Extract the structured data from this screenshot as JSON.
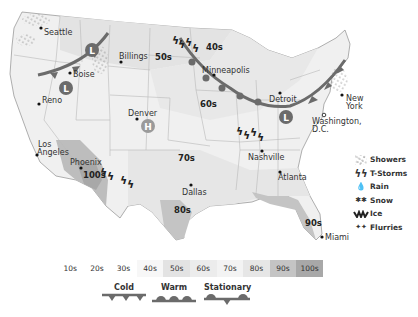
{
  "map": {
    "cities": [
      {
        "name": "Seattle"
      },
      {
        "name": "Boise"
      },
      {
        "name": "Billings"
      },
      {
        "name": "Reno"
      },
      {
        "name": "Denver"
      },
      {
        "name": "Minneapolis"
      },
      {
        "name": "Detroit"
      },
      {
        "name": "New York",
        "line1": "New",
        "line2": "York"
      },
      {
        "name": "Washington, D.C.",
        "line1": "Washington,",
        "line2": "D.C."
      },
      {
        "name": "Los Angeles",
        "line1": "Los",
        "line2": "Angeles"
      },
      {
        "name": "Phoenix"
      },
      {
        "name": "Dallas"
      },
      {
        "name": "Nashville"
      },
      {
        "name": "Atlanta"
      },
      {
        "name": "Miami"
      }
    ],
    "temp_labels": [
      "50s",
      "40s",
      "60s",
      "70s",
      "80s",
      "100s",
      "90s"
    ],
    "pressure_systems": [
      {
        "type": "low",
        "symbol": "L",
        "location": "Idaho/Montana"
      },
      {
        "type": "low",
        "symbol": "L",
        "location": "Oregon/Idaho"
      },
      {
        "type": "low",
        "symbol": "L",
        "location": "Ohio"
      },
      {
        "type": "high",
        "symbol": "H",
        "location": "Colorado"
      }
    ]
  },
  "temperature_legend": {
    "bands": [
      {
        "label": "10s",
        "color": "#ffffff"
      },
      {
        "label": "20s",
        "color": "#ffffff"
      },
      {
        "label": "30s",
        "color": "#ffffff"
      },
      {
        "label": "40s",
        "color": "#f7f7f7"
      },
      {
        "label": "50s",
        "color": "#e3e3e3"
      },
      {
        "label": "60s",
        "color": "#ececec"
      },
      {
        "label": "70s",
        "color": "#f3f3f3"
      },
      {
        "label": "80s",
        "color": "#e6e6e6"
      },
      {
        "label": "90s",
        "color": "#c4c4c4"
      },
      {
        "label": "100s",
        "color": "#a8a8a8"
      }
    ]
  },
  "front_legend": {
    "cold": "Cold",
    "warm": "Warm",
    "stationary": "Stationary"
  },
  "precip_legend": {
    "items": [
      {
        "label": "Showers",
        "icon": "showers-icon"
      },
      {
        "label": "T-Storms",
        "icon": "tstorms-icon"
      },
      {
        "label": "Rain",
        "icon": "rain-icon"
      },
      {
        "label": "Snow",
        "icon": "snow-icon"
      },
      {
        "label": "Ice",
        "icon": "ice-icon"
      },
      {
        "label": "Flurries",
        "icon": "flurries-icon"
      }
    ]
  },
  "colors": {
    "front": "#6b6b6b",
    "border": "#b8b8b8",
    "land": "#f2f2f2"
  }
}
